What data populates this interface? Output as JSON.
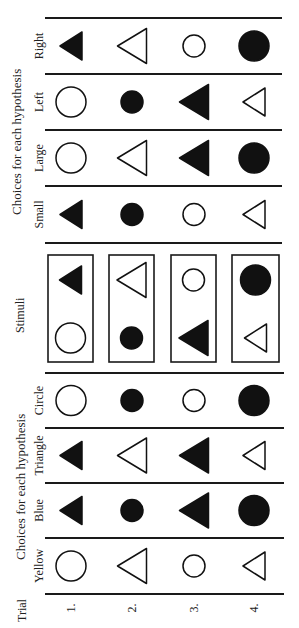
{
  "labels": {
    "trial": "Trial",
    "stimuli": "Stimuli",
    "group_top": "Choices for each hypothesis",
    "group_bottom": "Choices for each hypothesis"
  },
  "trials": [
    "1.",
    "2.",
    "3.",
    "4."
  ],
  "stimuli": [
    {
      "top": {
        "shape": "triangle",
        "fill": "black",
        "size": "small"
      },
      "bottom": {
        "shape": "circle",
        "fill": "white",
        "size": "large"
      }
    },
    {
      "top": {
        "shape": "triangle",
        "fill": "white",
        "size": "large"
      },
      "bottom": {
        "shape": "circle",
        "fill": "black",
        "size": "small"
      }
    },
    {
      "top": {
        "shape": "circle",
        "fill": "white",
        "size": "small"
      },
      "bottom": {
        "shape": "triangle",
        "fill": "black",
        "size": "large"
      }
    },
    {
      "top": {
        "shape": "circle",
        "fill": "black",
        "size": "large"
      },
      "bottom": {
        "shape": "triangle",
        "fill": "white",
        "size": "small"
      }
    }
  ],
  "hypotheses_top": [
    {
      "name": "Right",
      "choices": [
        {
          "shape": "triangle",
          "fill": "black",
          "size": "small"
        },
        {
          "shape": "triangle",
          "fill": "white",
          "size": "large"
        },
        {
          "shape": "circle",
          "fill": "white",
          "size": "small"
        },
        {
          "shape": "circle",
          "fill": "black",
          "size": "large"
        }
      ]
    },
    {
      "name": "Left",
      "choices": [
        {
          "shape": "circle",
          "fill": "white",
          "size": "large"
        },
        {
          "shape": "circle",
          "fill": "black",
          "size": "small"
        },
        {
          "shape": "triangle",
          "fill": "black",
          "size": "large"
        },
        {
          "shape": "triangle",
          "fill": "white",
          "size": "small"
        }
      ]
    },
    {
      "name": "Large",
      "choices": [
        {
          "shape": "circle",
          "fill": "white",
          "size": "large"
        },
        {
          "shape": "triangle",
          "fill": "white",
          "size": "large"
        },
        {
          "shape": "triangle",
          "fill": "black",
          "size": "large"
        },
        {
          "shape": "circle",
          "fill": "black",
          "size": "large"
        }
      ]
    },
    {
      "name": "Small",
      "choices": [
        {
          "shape": "triangle",
          "fill": "black",
          "size": "small"
        },
        {
          "shape": "circle",
          "fill": "black",
          "size": "small"
        },
        {
          "shape": "circle",
          "fill": "white",
          "size": "small"
        },
        {
          "shape": "triangle",
          "fill": "white",
          "size": "small"
        }
      ]
    }
  ],
  "hypotheses_bottom": [
    {
      "name": "Circle",
      "choices": [
        {
          "shape": "circle",
          "fill": "white",
          "size": "large"
        },
        {
          "shape": "circle",
          "fill": "black",
          "size": "small"
        },
        {
          "shape": "circle",
          "fill": "white",
          "size": "small"
        },
        {
          "shape": "circle",
          "fill": "black",
          "size": "large"
        }
      ]
    },
    {
      "name": "Triangle",
      "choices": [
        {
          "shape": "triangle",
          "fill": "black",
          "size": "small"
        },
        {
          "shape": "triangle",
          "fill": "white",
          "size": "large"
        },
        {
          "shape": "triangle",
          "fill": "black",
          "size": "large"
        },
        {
          "shape": "triangle",
          "fill": "white",
          "size": "small"
        }
      ]
    },
    {
      "name": "Blue",
      "choices": [
        {
          "shape": "triangle",
          "fill": "black",
          "size": "small"
        },
        {
          "shape": "circle",
          "fill": "black",
          "size": "small"
        },
        {
          "shape": "triangle",
          "fill": "black",
          "size": "large"
        },
        {
          "shape": "circle",
          "fill": "black",
          "size": "large"
        }
      ]
    },
    {
      "name": "Yellow",
      "choices": [
        {
          "shape": "circle",
          "fill": "white",
          "size": "large"
        },
        {
          "shape": "triangle",
          "fill": "white",
          "size": "large"
        },
        {
          "shape": "circle",
          "fill": "white",
          "size": "small"
        },
        {
          "shape": "triangle",
          "fill": "white",
          "size": "small"
        }
      ]
    }
  ],
  "colors": {
    "ink": "#111111",
    "paper": "#ffffff"
  }
}
